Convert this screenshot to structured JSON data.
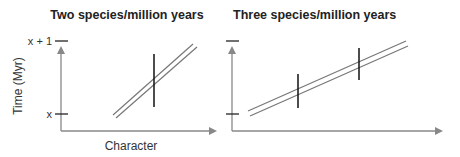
{
  "panels": [
    {
      "title": "Two species/million years",
      "y_axis_label": "Time (Myr)",
      "x_axis_label": "Character",
      "y_ticks": [
        "x + 1",
        "x"
      ]
    },
    {
      "title": "Three species/million years",
      "y_axis_label": "",
      "x_axis_label": "",
      "y_ticks": [
        "",
        ""
      ]
    }
  ],
  "colors": {
    "axis": "#888888",
    "lineage": "#777777",
    "speciation_mark": "#111111"
  }
}
